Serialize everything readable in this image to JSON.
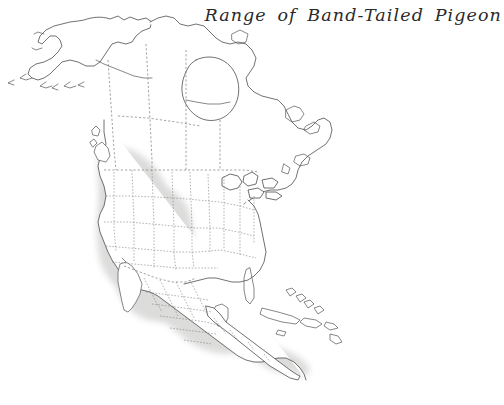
{
  "document": {
    "kind": "range-map-plate",
    "background_color": "#ffffff",
    "width": 504,
    "height": 405
  },
  "title": {
    "text": "Range of Band-Tailed Pigeon",
    "style": "italic-calligraphic-serif",
    "color": "#2a2a2a",
    "position": "top-right"
  },
  "map": {
    "subject": "North America",
    "projection_look": "conic",
    "species": "Band-Tailed Pigeon",
    "coastline_color": "#4c4c4c",
    "border_style": "dashed",
    "border_color": "#6f6f6f",
    "range_fill_color": "#dcdcdb",
    "land_fill_color": "#ffffff",
    "range_description": "Shaded area covers the Pacific coast from southern British Columbia south through Washington, Oregon, California, the Rocky Mountain interior states, mainland Mexico and Central America to Panama.",
    "regions_shaded": [
      "British Columbia",
      "Vancouver Island",
      "Washington",
      "Oregon",
      "California",
      "Idaho",
      "Nevada",
      "Utah",
      "Montana",
      "Wyoming",
      "Colorado",
      "Arizona",
      "New Mexico",
      "Mainland Mexico",
      "Guatemala",
      "Honduras",
      "Nicaragua",
      "Costa Rica",
      "Panama"
    ],
    "regions_unshaded": [
      "Alaska",
      "Baja California",
      "Central Canada",
      "Eastern Canada",
      "Great Plains",
      "Eastern United States",
      "Florida",
      "Cuba",
      "Hispaniola",
      "Bahamas"
    ],
    "features_drawn": [
      "Alaska and Aleutian Islands",
      "Hudson Bay",
      "Great Lakes",
      "Gulf of Mexico",
      "Labrador and Newfoundland",
      "Baja California peninsula",
      "Yucatan Peninsula",
      "Greater Antilles"
    ]
  }
}
